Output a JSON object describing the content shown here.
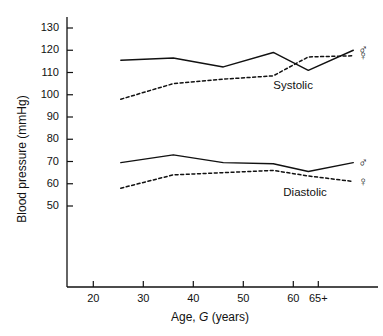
{
  "chart_data": {
    "type": "line",
    "title": "",
    "xlabel": "Age, G (years)",
    "ylabel": "Blood pressure (mmHg)",
    "xlim": [
      15,
      78
    ],
    "ylim": [
      44,
      134
    ],
    "grid": false,
    "legend_position": "inline-right-symbols",
    "x_ticks": [
      {
        "value": 20,
        "label": "20"
      },
      {
        "value": 30,
        "label": "30"
      },
      {
        "value": 40,
        "label": "40"
      },
      {
        "value": 50,
        "label": "50"
      },
      {
        "value": 60,
        "label": "60"
      },
      {
        "value": 65,
        "label": "65+"
      }
    ],
    "y_ticks": [
      {
        "value": 50,
        "label": "50"
      },
      {
        "value": 60,
        "label": "60"
      },
      {
        "value": 70,
        "label": "70"
      },
      {
        "value": 80,
        "label": "80"
      },
      {
        "value": 90,
        "label": "90"
      },
      {
        "value": 100,
        "label": "100"
      },
      {
        "value": 110,
        "label": "110"
      },
      {
        "value": 120,
        "label": "120"
      },
      {
        "value": 130,
        "label": "130"
      }
    ],
    "x": [
      25.5,
      36,
      46,
      56,
      63,
      72
    ],
    "series": [
      {
        "name": "Systolic male",
        "style": "solid",
        "color": "#111111",
        "sex_symbol": "male",
        "values": [
          115.5,
          116.5,
          112.5,
          119.0,
          111.0,
          120.0
        ]
      },
      {
        "name": "Systolic female",
        "style": "dashed",
        "color": "#111111",
        "sex_symbol": "female",
        "values": [
          98.0,
          105.0,
          107.0,
          108.5,
          117.0,
          117.5
        ]
      },
      {
        "name": "Diastolic male",
        "style": "solid",
        "color": "#111111",
        "sex_symbol": "male",
        "values": [
          69.5,
          73.0,
          69.5,
          69.0,
          65.5,
          69.5
        ]
      },
      {
        "name": "Diastolic female",
        "style": "dashed",
        "color": "#111111",
        "sex_symbol": "female",
        "values": [
          58.0,
          64.0,
          65.0,
          66.0,
          63.5,
          61.0
        ]
      }
    ],
    "annotations": [
      {
        "text": "Systolic",
        "x": 56,
        "y": 104
      },
      {
        "text": "Diastolic",
        "x": 58,
        "y": 56
      }
    ],
    "sex_symbols": {
      "male": "♂",
      "female": "♀"
    }
  },
  "axis_label_xlabel_parts": {
    "before": "Age, ",
    "italic": "G",
    "after": " (years)"
  }
}
